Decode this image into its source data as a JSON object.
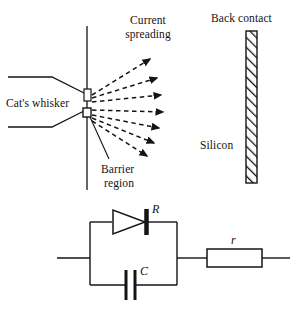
{
  "figure": {
    "title_present": false,
    "upper_diagram": {
      "labels": {
        "cats_whisker": "Cat's whisker",
        "current_spreading_line1": "Current",
        "current_spreading_line2": "spreading",
        "barrier_region_line1": "Barrier",
        "barrier_region_line2": "region",
        "back_contact": "Back contact",
        "silicon": "Silicon"
      },
      "elements": {
        "semiconductor_surface": "vertical-line",
        "contact_point": "whisker-tip",
        "barrier_box": "small-square",
        "spreading_arrows_count": 7,
        "back_contact_bar": "hatched-rectangle"
      }
    },
    "circuit_diagram": {
      "labels": {
        "diode_resistance": "R",
        "capacitance": "C",
        "series_resistance": "r"
      },
      "components": [
        {
          "name": "diode",
          "label": "R",
          "branch": "top"
        },
        {
          "name": "capacitor",
          "label": "C",
          "branch": "bottom"
        },
        {
          "name": "resistor",
          "label": "r",
          "branch": "series"
        }
      ]
    },
    "colors": {
      "ink": "#141414",
      "background": "#ffffff"
    }
  }
}
